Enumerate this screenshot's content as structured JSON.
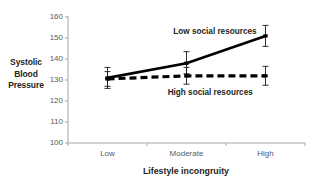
{
  "chart_data": {
    "type": "line",
    "title": "",
    "xlabel": "Lifestyle incongruity",
    "ylabel": "Systolic Blood Pressure",
    "ylabel_lines": [
      "Systolic",
      "Blood",
      "Pressure"
    ],
    "categories": [
      "Low",
      "Moderate",
      "High"
    ],
    "yticks": [
      100,
      110,
      120,
      130,
      140,
      150,
      160
    ],
    "ylim": [
      100,
      160
    ],
    "grid": false,
    "legend_position": "inline-annotations",
    "series": [
      {
        "name": "Low social resources",
        "style": "solid",
        "values": [
          131,
          138,
          151
        ],
        "errors_low": [
          127,
          133,
          146
        ],
        "errors_high": [
          136,
          143.5,
          156
        ]
      },
      {
        "name": "High social resources",
        "style": "dashed",
        "values": [
          130.5,
          132,
          132
        ],
        "errors_low": [
          126,
          128,
          127.5
        ],
        "errors_high": [
          134,
          136,
          136.5
        ]
      }
    ],
    "annotations": [
      {
        "text": "Low social resources",
        "x_frac": 0.62,
        "y_value": 153
      },
      {
        "text": "High social resources",
        "x_frac": 0.6,
        "y_value": 124
      }
    ]
  },
  "colors": {
    "line": "#000000",
    "axis": "#a6a6a6",
    "tick_text": "#5a5a5a",
    "label_text": "#231f20",
    "background": "#ffffff"
  }
}
